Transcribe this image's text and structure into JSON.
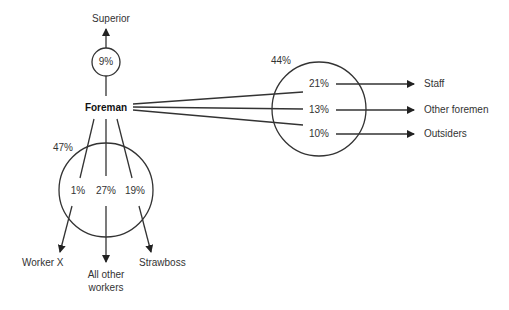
{
  "diagram": {
    "center_node": {
      "label": "Foreman"
    },
    "superior": {
      "label": "Superior",
      "percent": "9%"
    },
    "subordinates_group": {
      "total_percent": "47%",
      "items": [
        {
          "label": "Worker X",
          "percent": "1%"
        },
        {
          "label": "All other workers",
          "label_line1": "All other",
          "label_line2": "workers",
          "percent": "27%"
        },
        {
          "label": "Strawboss",
          "percent": "19%"
        }
      ]
    },
    "lateral_group": {
      "total_percent": "44%",
      "items": [
        {
          "label": "Staff",
          "percent": "21%"
        },
        {
          "label": "Other foremen",
          "percent": "13%"
        },
        {
          "label": "Outsiders",
          "percent": "10%"
        }
      ]
    },
    "colors": {
      "line": "#333333",
      "text": "#2a2a2a"
    }
  }
}
